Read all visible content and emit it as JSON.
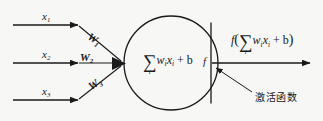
{
  "diagram": {
    "background_color": "#f7f7f5",
    "stroke_color": "#1a1a1a",
    "inputs": [
      {
        "label": "x",
        "index": "1",
        "weight_label": "W",
        "weight_index": "1"
      },
      {
        "label": "x",
        "index": "2",
        "weight_label": "W",
        "weight_index": "2"
      },
      {
        "label": "x",
        "index": "3",
        "weight_label": "W",
        "weight_index": "3"
      }
    ],
    "soma": {
      "sigma": "∑",
      "sigma_index": "i",
      "expression": "w",
      "expression_sub1": "i",
      "expression_var": "x",
      "expression_sub2": "i",
      "bias_term": "+ b",
      "activation_symbol": "f"
    },
    "output": {
      "function_symbol": "f",
      "open_paren": "(",
      "sigma": "∑",
      "sigma_index": "i",
      "expression": "w",
      "expression_sub1": "i",
      "expression_var": "x",
      "expression_sub2": "i",
      "bias_term": "+ b",
      "close_paren": ")"
    },
    "annotation": {
      "text": "激活函数"
    }
  }
}
